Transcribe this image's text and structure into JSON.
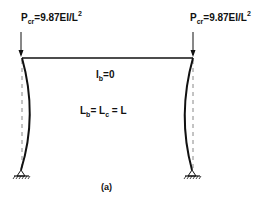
{
  "figure": {
    "caption": "(a)",
    "loads": {
      "left": {
        "symbol": "P",
        "subscript": "cr",
        "expression": "=9.87EI/L",
        "superscript": "2"
      },
      "right": {
        "symbol": "P",
        "subscript": "cr",
        "expression": "=9.87EI/L",
        "superscript": "2"
      }
    },
    "beam_property": {
      "symbol": "I",
      "subscript": "b",
      "expression": "=0"
    },
    "length_relation": {
      "lb_symbol": "L",
      "lb_subscript": "b",
      "eq1": "=",
      "lc_symbol": "L",
      "lc_subscript": "c",
      "eq2": "= L"
    },
    "colors": {
      "line": "#111111",
      "dashed": "#888888",
      "background": "#ffffff"
    }
  }
}
